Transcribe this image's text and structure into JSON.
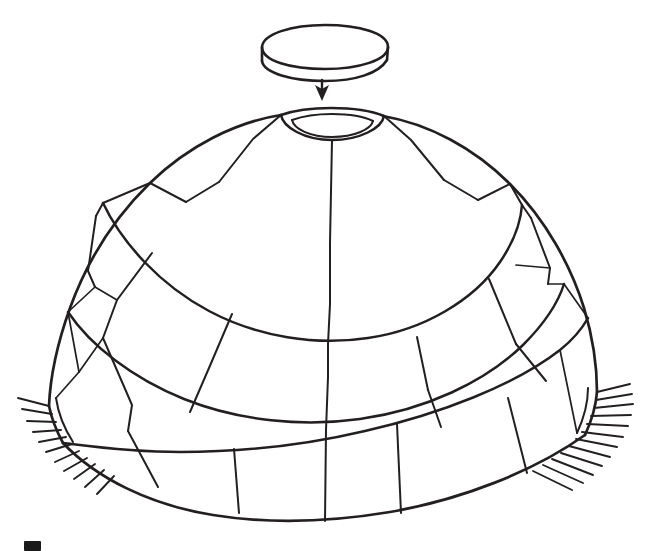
{
  "figure": {
    "kind": "line-drawing",
    "title": "Igloo with final key block being lowered into the roof opening",
    "background_color": "#ffffff",
    "ink_color": "#231f20",
    "caption": ""
  },
  "parts": [
    {
      "id": "key-block",
      "label": "key block",
      "name": "floating cap block",
      "shape": "flat elliptical slab drawn in 3/4 view with visible top face and front edge thickness",
      "center_x": 322,
      "center_y": 52,
      "width": 124,
      "height": 44
    },
    {
      "id": "placement-arrow",
      "label": "placement arrow",
      "name": "downward arrow",
      "direction": "down",
      "from_x": 322,
      "from_y": 79,
      "to_x": 322,
      "to_y": 99
    },
    {
      "id": "roof-opening",
      "label": "roof opening",
      "name": "top hole of dome",
      "shape": "ellipse rim drawn with a double line showing block thickness",
      "center_x": 330,
      "center_y": 124,
      "width": 104,
      "height": 30
    },
    {
      "id": "dome",
      "label": "dome",
      "name": "igloo dome body",
      "shape": "hemispherical shell of spiralling snow-block courses",
      "apex_y": 110,
      "base_y": 516,
      "left_x": 38,
      "right_x": 600
    },
    {
      "id": "ground-hatching",
      "label": "ground hatching",
      "name": "ground line hatch marks",
      "left_marks": 11,
      "right_marks": 12
    }
  ],
  "block_courses": [
    {
      "index": 1,
      "name": "top course",
      "blocks_visible": 5
    },
    {
      "index": 2,
      "name": "second course",
      "blocks_visible": 7
    },
    {
      "index": 3,
      "name": "third course",
      "blocks_visible": 7
    },
    {
      "index": 4,
      "name": "bottom course",
      "blocks_visible": 6
    }
  ],
  "corner_mark": {
    "name": "page-edge mark",
    "visible": true,
    "note": "small dark rectangle clipped at the lower-left edge of the page"
  }
}
